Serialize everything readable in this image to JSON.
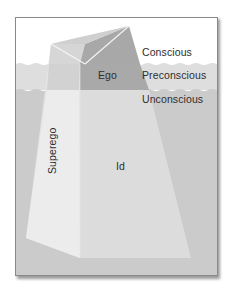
{
  "diagram": {
    "type": "iceberg-model-of-mind",
    "levels": [
      {
        "key": "conscious",
        "label": "Conscious"
      },
      {
        "key": "preconscious",
        "label": "Preconscious"
      },
      {
        "key": "unconscious",
        "label": "Unconscious"
      }
    ],
    "structures": [
      {
        "key": "ego",
        "label": "Ego"
      },
      {
        "key": "superego",
        "label": "Superego"
      },
      {
        "key": "id",
        "label": "Id"
      }
    ],
    "colors": {
      "sky": "#ffffff",
      "preconscious_water": "#dcdcdc",
      "unconscious_water": "#cbcbcb",
      "iceberg_light": "#ececec",
      "iceberg_mid": "#d9d9d9",
      "iceberg_dark": "#a9a9a9",
      "frame_border": "#8a8a8a"
    }
  }
}
